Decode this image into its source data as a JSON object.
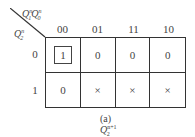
{
  "kmap": {
    "col_var": {
      "base": "Q",
      "a_sub": "1",
      "a_sup": "n",
      "b_sub": "0",
      "b_sup": "n"
    },
    "row_var": {
      "base": "Q",
      "sub": "2",
      "sup": "n"
    },
    "col_labels": [
      "00",
      "01",
      "11",
      "10"
    ],
    "row_labels": [
      "0",
      "1"
    ],
    "cells": [
      [
        "1",
        "0",
        "0",
        "0"
      ],
      [
        "0",
        "×",
        "×",
        "×"
      ]
    ],
    "grouped_cells": [
      [
        0,
        0
      ]
    ]
  },
  "caption": {
    "prefix": "(a) ",
    "base": "Q",
    "sub": "2",
    "sup": "n+1"
  }
}
